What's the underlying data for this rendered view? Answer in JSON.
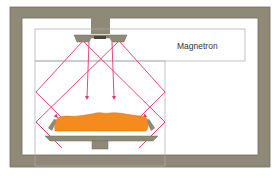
{
  "diagram": {
    "labels": {
      "magnetron": "Magnetron"
    },
    "colors": {
      "housing": "#8f8a78",
      "housing_edge": "#6f6a5a",
      "wave": "#e8336b",
      "food": "#f58a1f",
      "food_edge": "#e06f10",
      "box_line": "#a8a8a8",
      "tray": "#8f8a78"
    },
    "components": [
      {
        "id": "outer-housing",
        "name": "Oven housing"
      },
      {
        "id": "magnetron",
        "name": "Magnetron"
      },
      {
        "id": "wave-stirrer",
        "name": "Antenna / wave stirrer"
      },
      {
        "id": "cooking-chamber",
        "name": "Cooking chamber"
      },
      {
        "id": "food",
        "name": "Food"
      },
      {
        "id": "tray",
        "name": "Tray"
      },
      {
        "id": "tray-support",
        "name": "Tray support"
      }
    ]
  }
}
